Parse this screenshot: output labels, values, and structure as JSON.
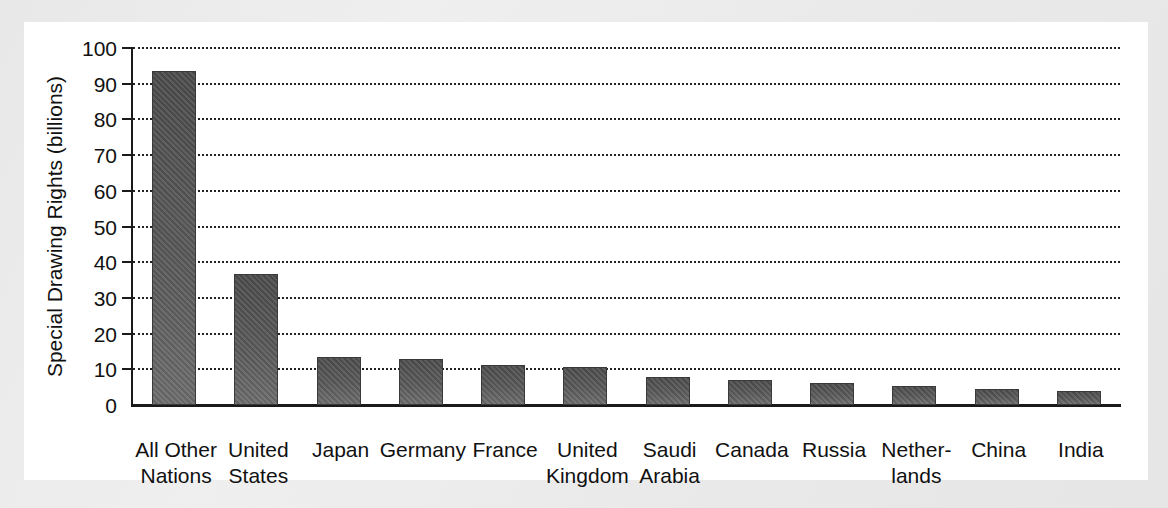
{
  "chart_data": {
    "type": "bar",
    "title": "",
    "xlabel": "",
    "ylabel": "Special Drawing Rights (billions)",
    "ylim": [
      0,
      100
    ],
    "ytick_step": 10,
    "yticks": [
      0,
      10,
      20,
      30,
      40,
      50,
      60,
      70,
      80,
      90,
      100
    ],
    "ytick_labels": [
      "0",
      "10",
      "20",
      "30",
      "40",
      "50",
      "60",
      "70",
      "80",
      "90",
      "100"
    ],
    "grid": true,
    "grid_style": "dotted-horizontal",
    "legend": "none",
    "categories": [
      "All Other\nNations",
      "United\nStates",
      "Japan",
      "Germany",
      "France",
      "United\nKingdom",
      "Saudi\nArabia",
      "Canada",
      "Russia",
      "Nether-\nlands",
      "China",
      "India"
    ],
    "values": [
      93.5,
      36.7,
      13.4,
      12.9,
      11.2,
      10.6,
      7.8,
      7.0,
      6.2,
      5.3,
      4.4,
      3.8
    ],
    "bar_color": "#575757",
    "axis_color": "#1a1a1a"
  },
  "colors": {
    "page_background": "#ececed",
    "panel_background": "#ffffff",
    "text": "#111111",
    "bar_fill": "#575757",
    "bar_edge": "#3a3a3a",
    "gridline": "#222222"
  }
}
